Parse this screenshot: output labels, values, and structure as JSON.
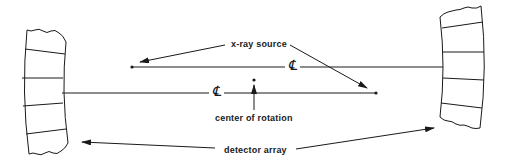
{
  "diagram": {
    "labels": {
      "xray_source": "x-ray source",
      "center_of_rotation": "center of rotation",
      "detector_array": "detector array",
      "centerline_upper": "℄",
      "centerline_lower": "℄"
    },
    "colors": {
      "stroke": "#1a1a1a",
      "background": "#ffffff"
    }
  }
}
